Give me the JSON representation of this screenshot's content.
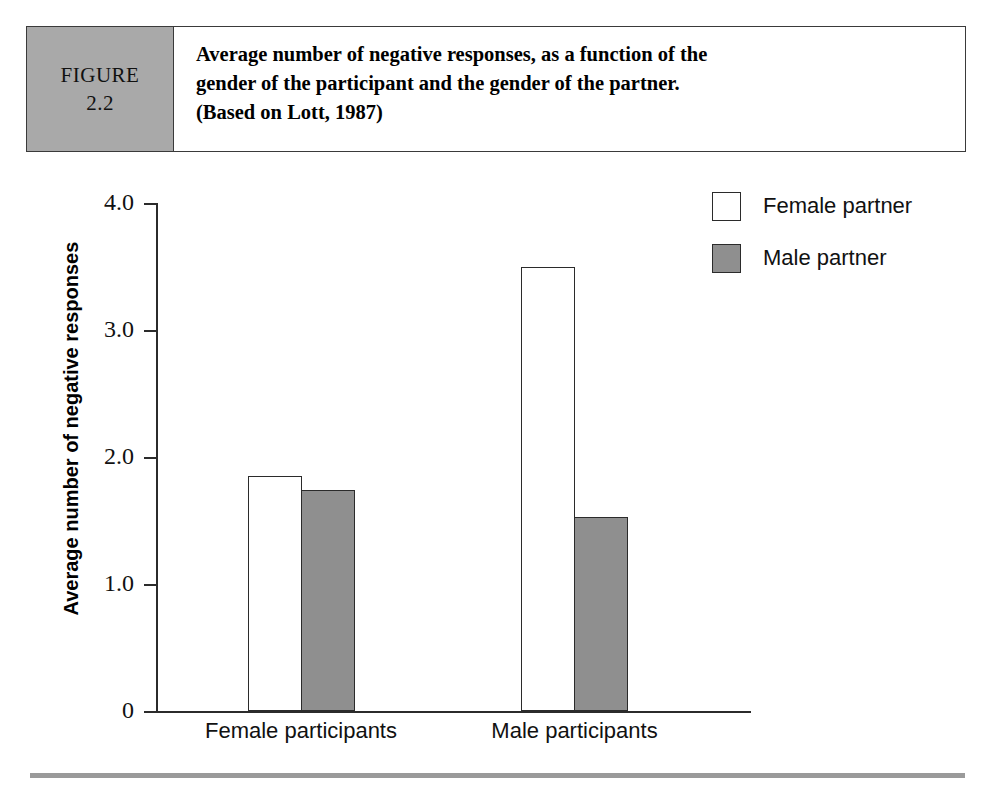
{
  "figure": {
    "tag_label": "FIGURE",
    "tag_number": "2.2",
    "caption_line1": "Average number of negative responses, as a function of the",
    "caption_line2": "gender of the participant and the gender of the partner.",
    "caption_line3": "(Based on Lott, 1987)"
  },
  "colors": {
    "female_partner_fill": "#ffffff",
    "male_partner_fill": "#8f8f8f",
    "outline": "#2b2b2b",
    "figure_tag_bg": "#a9a9a9",
    "bottom_rule": "#9a9a9a"
  },
  "chart_data": {
    "type": "bar",
    "title": "Average number of negative responses, as a function of the gender of the participant and the gender of the partner. (Based on Lott, 1987)",
    "xlabel": "",
    "ylabel": "Average number of negative responses",
    "categories": [
      "Female participants",
      "Male participants"
    ],
    "series": [
      {
        "name": "Female partner",
        "values": [
          1.85,
          3.5
        ],
        "fill": "#ffffff"
      },
      {
        "name": "Male partner",
        "values": [
          1.74,
          1.53
        ],
        "fill": "#8f8f8f"
      }
    ],
    "ylim": [
      0,
      4.0
    ],
    "yticks": [
      0,
      1.0,
      2.0,
      3.0,
      4.0
    ],
    "ytick_labels": [
      "0",
      "1.0",
      "2.0",
      "3.0",
      "4.0"
    ],
    "grid": false,
    "legend_position": "top-right",
    "legend_entries": [
      "Female partner",
      "Male partner"
    ]
  },
  "axis": {
    "ytick_0": "0",
    "ytick_1": "1.0",
    "ytick_2": "2.0",
    "ytick_3": "3.0",
    "ytick_4": "4.0",
    "y_title": "Average number of negative responses",
    "xlabel_0": "Female participants",
    "xlabel_1": "Male participants"
  },
  "legend": {
    "item_0": "Female partner",
    "item_1": "Male partner"
  }
}
